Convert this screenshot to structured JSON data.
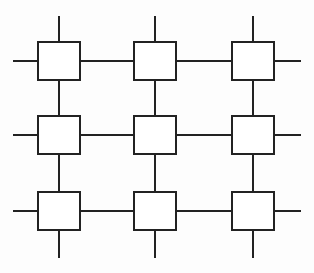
{
  "diagram": {
    "title": "",
    "type": "mesh-grid-3x3",
    "stroke_color": "#222222",
    "stroke_width": 2,
    "background": "#fdfdfd",
    "box_fill": "#ffffff",
    "columns_x": [
      59,
      155,
      253
    ],
    "rows_y": [
      61,
      135,
      211
    ],
    "box_half_width": 21,
    "box_half_height": 19,
    "outer_stub": {
      "left_x": 13,
      "right_x": 301,
      "top_y": 16,
      "bottom_y": 258
    },
    "nodes": [
      {
        "id": "n00",
        "row": 0,
        "col": 0,
        "label": ""
      },
      {
        "id": "n01",
        "row": 0,
        "col": 1,
        "label": ""
      },
      {
        "id": "n02",
        "row": 0,
        "col": 2,
        "label": ""
      },
      {
        "id": "n10",
        "row": 1,
        "col": 0,
        "label": ""
      },
      {
        "id": "n11",
        "row": 1,
        "col": 1,
        "label": ""
      },
      {
        "id": "n12",
        "row": 1,
        "col": 2,
        "label": ""
      },
      {
        "id": "n20",
        "row": 2,
        "col": 0,
        "label": ""
      },
      {
        "id": "n21",
        "row": 2,
        "col": 1,
        "label": ""
      },
      {
        "id": "n22",
        "row": 2,
        "col": 2,
        "label": ""
      }
    ]
  }
}
